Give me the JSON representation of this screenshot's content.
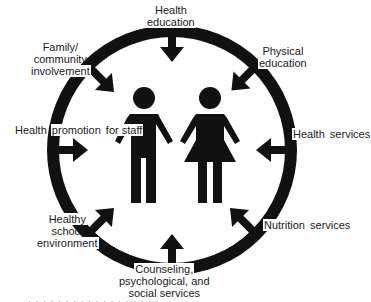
{
  "diagram": {
    "colors": {
      "ink": "#111111",
      "background": "#ffffff",
      "text": "#1a1a1a"
    },
    "center_figures": [
      {
        "name": "male-figure",
        "icon": "person-male-icon"
      },
      {
        "name": "female-figure",
        "icon": "person-female-icon"
      }
    ],
    "components": [
      {
        "id": "health-education",
        "lines": [
          "Health",
          "education"
        ],
        "arrow_direction": "down"
      },
      {
        "id": "physical-education",
        "lines": [
          "Physical",
          "education"
        ],
        "arrow_direction": "down-left"
      },
      {
        "id": "health-services",
        "lines": [
          "Health",
          "services"
        ],
        "arrow_direction": "left"
      },
      {
        "id": "nutrition-services",
        "lines": [
          "Nutrition",
          "services"
        ],
        "arrow_direction": "up-left"
      },
      {
        "id": "counseling-services",
        "lines": [
          "Counseling,",
          "psychological, and",
          "social services"
        ],
        "arrow_direction": "up"
      },
      {
        "id": "healthy-school-environment",
        "lines": [
          "Healthy",
          "school",
          "environment"
        ],
        "arrow_direction": "up-right"
      },
      {
        "id": "health-promotion-staff",
        "lines": [
          "Health",
          "promotion",
          "for staff"
        ],
        "arrow_direction": "right"
      },
      {
        "id": "family-community",
        "lines": [
          "Family/",
          "community",
          "involvement"
        ],
        "arrow_direction": "down-right"
      }
    ],
    "caption": "· · · · · · · · · · · · · · · · · ·"
  }
}
